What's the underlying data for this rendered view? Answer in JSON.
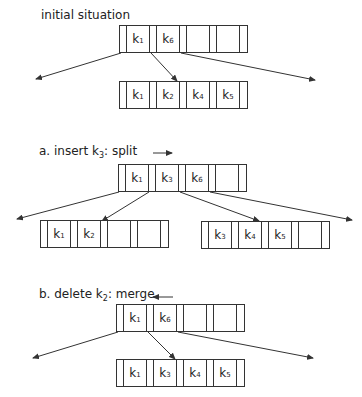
{
  "sections": [
    {
      "id": "initial",
      "label": "initial situation",
      "label_sub": "",
      "label_tail": "",
      "direction_arrow": "",
      "root": {
        "keys": [
          "k1",
          "k6",
          "",
          ""
        ]
      },
      "leaves": [
        {
          "keys": [
            "k1",
            "k2",
            "k4",
            "k5"
          ]
        }
      ]
    },
    {
      "id": "insert",
      "label": "a.  insert k",
      "label_sub": "3",
      "label_tail": ": split",
      "direction_arrow": "right",
      "root": {
        "keys": [
          "k1",
          "k3",
          "k6",
          ""
        ]
      },
      "leaves": [
        {
          "keys": [
            "k1",
            "k2",
            "",
            ""
          ]
        },
        {
          "keys": [
            "k3",
            "k4",
            "k5",
            ""
          ]
        }
      ]
    },
    {
      "id": "delete",
      "label": "b.  delete k",
      "label_sub": "2",
      "label_tail": ": merge",
      "direction_arrow": "left",
      "root": {
        "keys": [
          "k1",
          "k6",
          "",
          ""
        ]
      },
      "leaves": [
        {
          "keys": [
            "k1",
            "k3",
            "k4",
            "k5"
          ]
        }
      ]
    }
  ],
  "colors": {
    "line": "#333333",
    "text": "#222222",
    "background": "#ffffff"
  }
}
